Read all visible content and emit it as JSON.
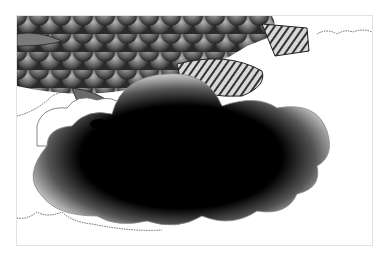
{
  "artwork": {
    "title": "Stippled fish over cloud illustration",
    "subjects": [
      "fish-with-scales",
      "dark-cloud",
      "outlined-clouds"
    ],
    "colors": {
      "ink": "#000000",
      "paper": "#ffffff",
      "frame_border": "#e2e2e2",
      "scale_mid": "#5a5a5a",
      "scale_light": "#9a9a9a"
    }
  }
}
